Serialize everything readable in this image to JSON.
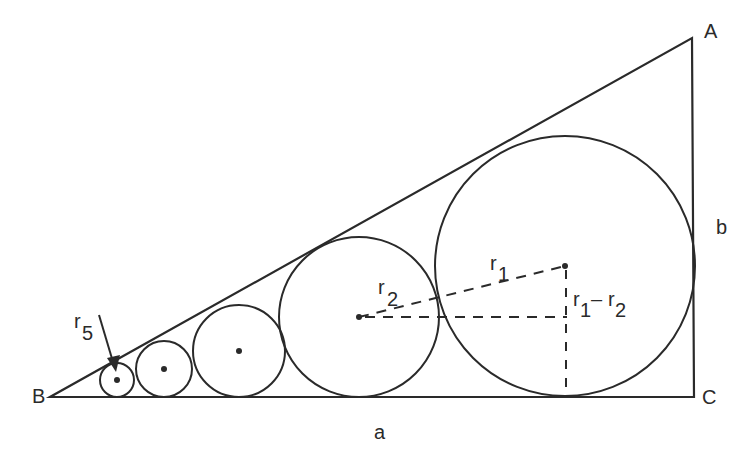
{
  "diagram": {
    "colors": {
      "stroke": "#2a2a2a",
      "background": "#ffffff"
    },
    "vertices": {
      "A": {
        "label": "A",
        "x": 692,
        "y": 38
      },
      "B": {
        "label": "B",
        "x": 50,
        "y": 397
      },
      "C": {
        "label": "C",
        "x": 694,
        "y": 397
      }
    },
    "sides": {
      "a": {
        "label": "a"
      },
      "b": {
        "label": "b"
      }
    },
    "circles": [
      {
        "name": "circle-1",
        "cx": 565,
        "cy": 266,
        "r": 130
      },
      {
        "name": "circle-2",
        "cx": 359,
        "cy": 317,
        "r": 80
      },
      {
        "name": "circle-3",
        "cx": 239,
        "cy": 351,
        "r": 46
      },
      {
        "name": "circle-4",
        "cx": 164,
        "cy": 369,
        "r": 28
      },
      {
        "name": "circle-5",
        "cx": 117,
        "cy": 380,
        "r": 17
      }
    ],
    "labels": {
      "r1": {
        "base": "r",
        "sub": "1"
      },
      "r2": {
        "base": "r",
        "sub": "2"
      },
      "r5": {
        "base": "r",
        "sub": "5"
      },
      "diff": {
        "base1": "r",
        "sub1": "1",
        "minus": "–",
        "base2": "r",
        "sub2": "2"
      }
    }
  }
}
